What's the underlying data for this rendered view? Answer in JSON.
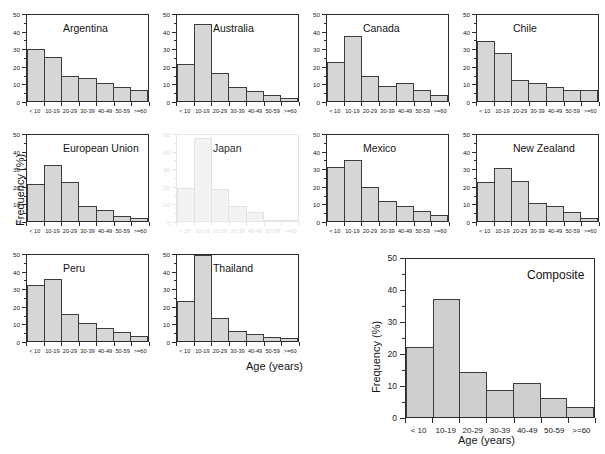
{
  "figure": {
    "xlabel": "Age (years)",
    "ylabel": "Frequency (%)"
  },
  "chart_data": [
    {
      "type": "bar",
      "title": "Argentina",
      "categories": [
        "< 10",
        "10-19",
        "20-29",
        "30-39",
        "40-49",
        "50-59",
        ">=60"
      ],
      "values": [
        29.8,
        25.0,
        14.0,
        13.0,
        10.5,
        8.0,
        6.0
      ],
      "ylim": [
        0,
        50
      ],
      "yticks": [
        0,
        10,
        20,
        30,
        40,
        50
      ],
      "xlabel": "Age (years)",
      "ylabel": "Frequency (%)"
    },
    {
      "type": "bar",
      "title": "Australia",
      "categories": [
        "< 10",
        "10-19",
        "20-29",
        "30-39",
        "40-49",
        "50-59",
        ">=60"
      ],
      "values": [
        21.0,
        43.5,
        16.0,
        8.0,
        5.5,
        3.5,
        1.5
      ],
      "ylim": [
        0,
        50
      ],
      "yticks": [
        0,
        10,
        20,
        30,
        40,
        50
      ],
      "xlabel": "Age (years)",
      "ylabel": "Frequency (%)"
    },
    {
      "type": "bar",
      "title": "Canada",
      "categories": [
        "< 10",
        "10-19",
        "20-29",
        "30-39",
        "40-49",
        "50-59",
        ">=60"
      ],
      "values": [
        22.0,
        37.0,
        14.0,
        8.5,
        10.5,
        6.0,
        3.5
      ],
      "ylim": [
        0,
        50
      ],
      "yticks": [
        0,
        10,
        20,
        30,
        40,
        50
      ],
      "xlabel": "Age (years)",
      "ylabel": "Frequency (%)"
    },
    {
      "type": "bar",
      "title": "Chile",
      "categories": [
        "< 10",
        "10-19",
        "20-29",
        "30-39",
        "40-49",
        "50-59",
        ">=60"
      ],
      "values": [
        34.0,
        27.0,
        12.0,
        10.0,
        8.0,
        6.5,
        6.0
      ],
      "ylim": [
        0,
        50
      ],
      "yticks": [
        0,
        10,
        20,
        30,
        40,
        50
      ],
      "xlabel": "Age (years)",
      "ylabel": "Frequency (%)"
    },
    {
      "type": "bar",
      "title": "European Union",
      "categories": [
        "< 10",
        "10-19",
        "20-29",
        "30-39",
        "40-49",
        "50-59",
        ">=60"
      ],
      "values": [
        21.0,
        32.0,
        22.0,
        8.5,
        6.0,
        3.0,
        1.5
      ],
      "ylim": [
        0,
        50
      ],
      "yticks": [
        0,
        10,
        20,
        30,
        40,
        50
      ],
      "xlabel": "Age (years)",
      "ylabel": "Frequency (%)"
    },
    {
      "type": "bar",
      "title": "Japan",
      "categories": [
        "< 10",
        "10-19",
        "20-29",
        "30-39",
        "40-49",
        "50-59",
        ">=60"
      ],
      "values": [
        19.0,
        47.0,
        18.0,
        8.5,
        5.0,
        0.8,
        0.4
      ],
      "ylim": [
        0,
        50
      ],
      "yticks": [
        0,
        10,
        20,
        30,
        40,
        50
      ],
      "xlabel": "Age (years)",
      "ylabel": "Frequency (%)"
    },
    {
      "type": "bar",
      "title": "Mexico",
      "categories": [
        "< 10",
        "10-19",
        "20-29",
        "30-39",
        "40-49",
        "50-59",
        ">=60"
      ],
      "values": [
        30.5,
        34.5,
        19.5,
        11.5,
        8.5,
        5.5,
        3.5
      ],
      "ylim": [
        0,
        50
      ],
      "yticks": [
        0,
        10,
        20,
        30,
        40,
        50
      ],
      "xlabel": "Age (years)",
      "ylabel": "Frequency (%)"
    },
    {
      "type": "bar",
      "title": "New Zealand",
      "categories": [
        "< 10",
        "10-19",
        "20-29",
        "30-39",
        "40-49",
        "50-59",
        ">=60"
      ],
      "values": [
        22.0,
        30.0,
        22.5,
        10.0,
        8.5,
        5.0,
        1.5
      ],
      "ylim": [
        0,
        50
      ],
      "yticks": [
        0,
        10,
        20,
        30,
        40,
        50
      ],
      "xlabel": "Age (years)",
      "ylabel": "Frequency (%)"
    },
    {
      "type": "bar",
      "title": "Peru",
      "categories": [
        "< 10",
        "10-19",
        "20-29",
        "30-39",
        "40-49",
        "50-59",
        ">=60"
      ],
      "values": [
        32.0,
        35.0,
        15.5,
        10.5,
        7.5,
        5.0,
        3.0
      ],
      "ylim": [
        0,
        50
      ],
      "yticks": [
        0,
        10,
        20,
        30,
        40,
        50
      ],
      "xlabel": "Age (years)",
      "ylabel": "Frequency (%)"
    },
    {
      "type": "bar",
      "title": "Thailand",
      "categories": [
        "< 10",
        "10-19",
        "20-29",
        "30-39",
        "40-49",
        "50-59",
        ">=60"
      ],
      "values": [
        23.0,
        49.0,
        13.0,
        5.5,
        4.0,
        2.0,
        1.5
      ],
      "ylim": [
        0,
        50
      ],
      "yticks": [
        0,
        10,
        20,
        30,
        40,
        50
      ],
      "xlabel": "Age (years)",
      "ylabel": "Frequency (%)"
    },
    {
      "type": "bar",
      "title": "Composite",
      "categories": [
        "< 10",
        "10-19",
        "20-29",
        "30-39",
        "40-49",
        "50-59",
        ">=60"
      ],
      "values": [
        21.8,
        37.0,
        14.0,
        8.5,
        10.5,
        6.0,
        3.0
      ],
      "ylim": [
        0,
        50
      ],
      "yticks": [
        0,
        10,
        20,
        30,
        40,
        50
      ],
      "xlabel": "Age (years)",
      "ylabel": "Frequency (%)"
    }
  ]
}
